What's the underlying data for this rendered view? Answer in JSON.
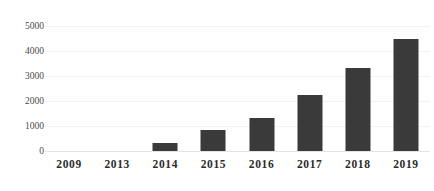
{
  "chart_data": {
    "type": "bar",
    "title": "",
    "xlabel": "",
    "ylabel": "",
    "categories": [
      "2009",
      "2013",
      "2014",
      "2015",
      "2016",
      "2017",
      "2018",
      "2019"
    ],
    "values": [
      0,
      0,
      320,
      840,
      1320,
      2240,
      3320,
      4480
    ],
    "ylim": [
      0,
      5000
    ],
    "yticks": [
      0,
      1000,
      2000,
      3000,
      4000,
      5000
    ],
    "ytick_labels": [
      "0",
      "1000",
      "2000",
      "3000",
      "4000",
      "5000"
    ],
    "grid": true,
    "legend": false,
    "bar_color": "#3a3a3a",
    "grid_color": "#f2f2f2",
    "axis_text_color": "#2b2b2b"
  },
  "watermark": {
    "text": " "
  }
}
